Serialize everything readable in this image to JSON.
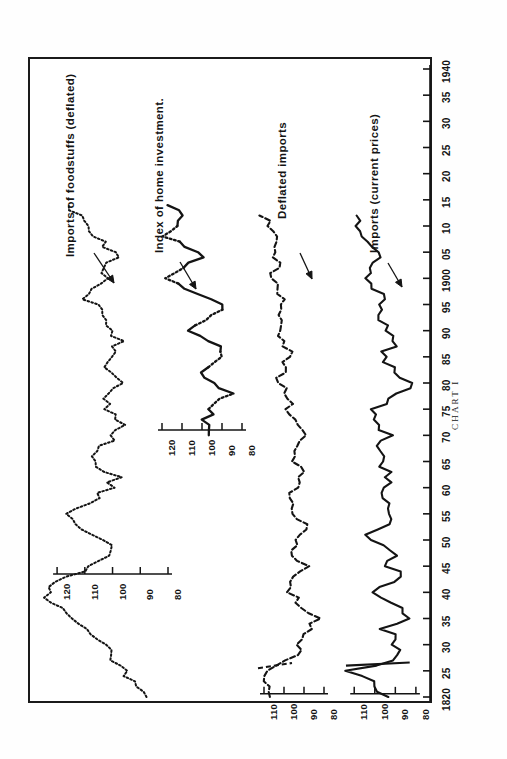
{
  "figure": {
    "caption": "CHART I",
    "orientation": "rotated-90",
    "frame_color": "#1a1a1a",
    "ink_color": "#141414"
  },
  "series_labels": {
    "foodstuffs": "Imports of foodstuffs  (deflated)",
    "home_investment": "Index of home investment.",
    "deflated_imports": "Deflated imports",
    "imports_current": "Imports (current prices)"
  },
  "x_axis": {
    "label": "",
    "ticks": [
      "1820",
      "25",
      "30",
      "35",
      "40",
      "45",
      "50",
      "55",
      "60",
      "65",
      "70",
      "75",
      "80",
      "85",
      "90",
      "95",
      "1900",
      "05",
      "10",
      "15",
      "20",
      "25",
      "30",
      "35",
      "1940"
    ],
    "range": [
      1820,
      1940
    ]
  },
  "value_axes": [
    {
      "name": "foodstuffs-scale",
      "ticks": [
        "120",
        "110",
        "100",
        "90",
        "80"
      ]
    },
    {
      "name": "home-investment-scale",
      "ticks": [
        "120",
        "110",
        "100",
        "90",
        "80"
      ]
    },
    {
      "name": "deflated-imports-scale",
      "ticks": [
        "110",
        "100",
        "90",
        "80"
      ]
    },
    {
      "name": "imports-current-scale",
      "ticks": [
        "110",
        "100",
        "90",
        "80"
      ]
    }
  ],
  "chart_data": {
    "type": "line",
    "title": "CHART I",
    "xlabel": "",
    "ylabel": "Index (1880 = 100)",
    "xlim": [
      1820,
      1940
    ],
    "grid": false,
    "legend": "annotated-inline",
    "panels": [
      {
        "name": "Imports of foodstuffs  (deflated)",
        "style": "dotted",
        "ylim": [
          80,
          125
        ],
        "yticks": [
          120,
          110,
          100,
          90,
          80
        ],
        "x": [
          1820,
          1822,
          1824,
          1826,
          1828,
          1830,
          1832,
          1834,
          1836,
          1838,
          1840,
          1842,
          1844,
          1846,
          1848,
          1850,
          1852,
          1854,
          1856,
          1858,
          1860,
          1862,
          1864,
          1866,
          1868,
          1870,
          1872,
          1874,
          1876,
          1878,
          1880,
          1882,
          1884,
          1886,
          1888,
          1890,
          1892,
          1894,
          1896,
          1898,
          1900,
          1902,
          1904,
          1906,
          1908,
          1910,
          1912,
          1914
        ],
        "values": [
          89,
          92,
          95,
          98,
          101,
          104,
          107,
          112,
          118,
          122,
          124,
          120,
          112,
          106,
          101,
          104,
          110,
          116,
          113,
          106,
          101,
          99,
          104,
          108,
          104,
          99,
          96,
          99,
          103,
          100,
          97,
          100,
          104,
          101,
          98,
          100,
          103,
          106,
          109,
          107,
          104,
          101,
          100,
          102,
          105,
          108,
          112,
          116
        ]
      },
      {
        "name": "Index of home investment.",
        "style": "solid-dotted",
        "ylim": [
          78,
          125
        ],
        "yticks": [
          120,
          110,
          100,
          90,
          80
        ],
        "x": [
          1870,
          1872,
          1874,
          1876,
          1878,
          1880,
          1882,
          1884,
          1886,
          1888,
          1890,
          1892,
          1894,
          1896,
          1898,
          1900,
          1902,
          1904,
          1906,
          1908,
          1910,
          1912,
          1914
        ],
        "values": [
          99,
          99,
          97,
          92,
          86,
          93,
          100,
          94,
          88,
          95,
          105,
          99,
          90,
          95,
          108,
          120,
          112,
          99,
          108,
          118,
          113,
          108,
          117
        ]
      },
      {
        "name": "Deflated imports",
        "style": "dashed",
        "ylim": [
          78,
          115
        ],
        "yticks": [
          110,
          100,
          90,
          80
        ],
        "x": [
          1820,
          1823,
          1825,
          1827,
          1830,
          1833,
          1835,
          1838,
          1840,
          1843,
          1845,
          1848,
          1850,
          1853,
          1855,
          1858,
          1860,
          1863,
          1865,
          1868,
          1870,
          1873,
          1875,
          1878,
          1880,
          1883,
          1885,
          1888,
          1890,
          1893,
          1895,
          1898,
          1900,
          1903,
          1905,
          1908,
          1910,
          1912
        ],
        "values": [
          109,
          110,
          106,
          97,
          92,
          88,
          84,
          92,
          97,
          94,
          90,
          96,
          93,
          90,
          94,
          97,
          93,
          90,
          94,
          92,
          90,
          94,
          97,
          99,
          102,
          100,
          97,
          100,
          104,
          101,
          99,
          102,
          106,
          104,
          102,
          105,
          108,
          110
        ]
      },
      {
        "name": "Imports (current prices)",
        "style": "solid",
        "ylim": [
          78,
          115
        ],
        "yticks": [
          110,
          100,
          90,
          80
        ],
        "x": [
          1820,
          1823,
          1825,
          1827,
          1830,
          1833,
          1835,
          1838,
          1840,
          1843,
          1845,
          1848,
          1850,
          1853,
          1855,
          1858,
          1860,
          1863,
          1865,
          1868,
          1870,
          1873,
          1875,
          1878,
          1880,
          1883,
          1885,
          1888,
          1890,
          1893,
          1895,
          1898,
          1900,
          1903,
          1905,
          1908,
          1910,
          1912
        ],
        "values": [
          96,
          103,
          112,
          91,
          89,
          95,
          83,
          92,
          99,
          86,
          95,
          90,
          105,
          96,
          91,
          98,
          95,
          92,
          98,
          96,
          94,
          102,
          99,
          88,
          83,
          92,
          97,
          89,
          93,
          98,
          95,
          100,
          105,
          101,
          99,
          104,
          107,
          110
        ]
      }
    ]
  }
}
